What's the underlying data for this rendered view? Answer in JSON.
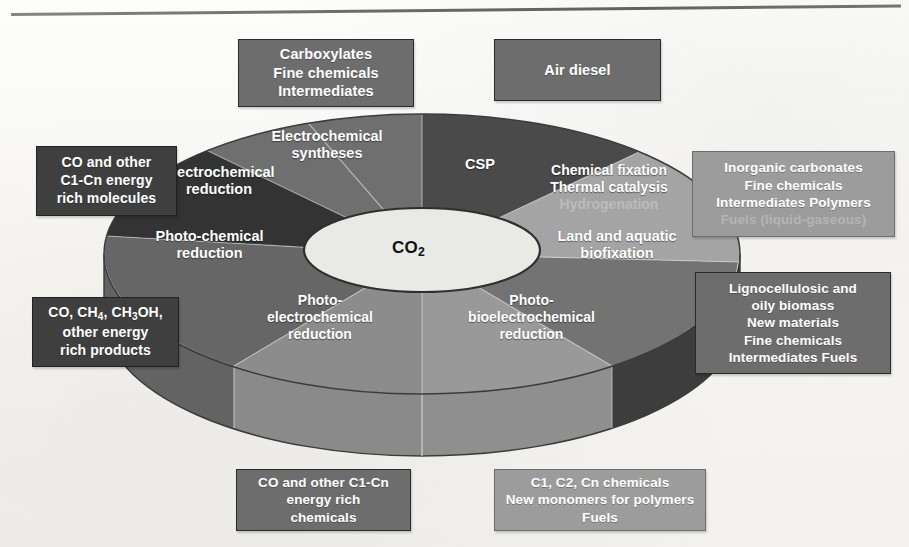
{
  "figure": {
    "center_label": "CO",
    "center_sub": "2",
    "title_rule": true
  },
  "sectors": [
    {
      "id": "electrochemical-syntheses",
      "label_lines": [
        "Electrochemical",
        "syntheses"
      ],
      "fill": "#6f6f6f"
    },
    {
      "id": "csp",
      "label_lines": [
        "CSP"
      ],
      "fill": "#4a4a4a"
    },
    {
      "id": "chemical-fixation",
      "label_lines": [
        "Chemical fixation",
        "Thermal catalysis"
      ],
      "faded_line": "Hydrogenation",
      "fill": "#a3a3a3"
    },
    {
      "id": "land-aquatic-biofixation",
      "label_lines": [
        "Land and aquatic",
        "biofixation"
      ],
      "fill": "#767676"
    },
    {
      "id": "photo-bioelectrochemical",
      "label_lines": [
        "Photo-",
        "bioelectrochemical",
        "reduction"
      ],
      "fill": "#9a9a9a"
    },
    {
      "id": "photo-electrochemical",
      "label_lines": [
        "Photo-",
        "electrochemical",
        "reduction"
      ],
      "fill": "#8e8e8e"
    },
    {
      "id": "photo-chemical-reduction",
      "label_lines": [
        "Photo-chemical",
        "reduction"
      ],
      "fill": "#6a6a6a"
    },
    {
      "id": "electrochemical-reduction",
      "label_lines": [
        "Electrochemical",
        "reduction"
      ],
      "fill": "#3a3a3a"
    }
  ],
  "callouts": {
    "top_left": {
      "id": "carboxylates-box",
      "tone": "dark",
      "lines": [
        "Carboxylates",
        "Fine chemicals",
        "Intermediates"
      ]
    },
    "top_right": {
      "id": "air-diesel-box",
      "tone": "dark",
      "lines": [
        "Air diesel"
      ]
    },
    "left_upper": {
      "id": "co-c1cn-molecules-box",
      "tone": "darker",
      "lines": [
        "CO and other",
        "C1-Cn energy",
        "rich molecules"
      ]
    },
    "left_lower": {
      "id": "co-ch4-ch3oh-box",
      "tone": "darker",
      "lines_rich": [
        [
          {
            "t": "CO, CH"
          },
          {
            "sub": "4"
          },
          {
            "t": ", CH"
          },
          {
            "sub": "3"
          },
          {
            "t": "OH,"
          }
        ],
        [
          {
            "t": "other energy"
          }
        ],
        [
          {
            "t": "rich products"
          }
        ]
      ]
    },
    "right_upper": {
      "id": "inorganic-carbonates-box",
      "tone": "light",
      "lines": [
        "Inorganic carbonates",
        "Fine chemicals",
        "Intermediates Polymers"
      ],
      "faded_line": "Fuels (liquid-gaseous)"
    },
    "right_lower": {
      "id": "lignocellulosic-biomass-box",
      "tone": "dark",
      "lines": [
        "Lignocellulosic and",
        "oily biomass",
        "New materials",
        "Fine chemicals",
        "Intermediates Fuels"
      ]
    },
    "bottom_left": {
      "id": "co-c1cn-chemicals-box",
      "tone": "dark",
      "lines": [
        "CO and other C1-Cn",
        "energy rich",
        "chemicals"
      ]
    },
    "bottom_right": {
      "id": "c1-c2-cn-chemicals-box",
      "tone": "light",
      "lines": [
        "C1, C2, Cn chemicals",
        "New monomers for polymers",
        "Fuels"
      ]
    }
  },
  "colors": {
    "page_background": "#fbfaf8",
    "box_dark": "#6d6d6d",
    "box_darker": "#3f3f3f",
    "box_light": "#9c9c9c",
    "center_ellipse": "#e8e8e4",
    "rule": "#5f5e5c"
  }
}
